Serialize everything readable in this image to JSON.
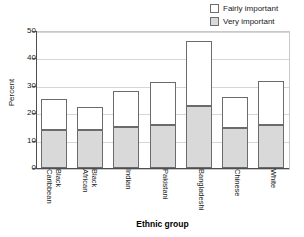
{
  "chart_data": {
    "type": "bar",
    "subtype": "stacked-vertical",
    "title": "",
    "xlabel": "Ethnic group",
    "ylabel": "Percent",
    "ylim": [
      0,
      50
    ],
    "yticks": [
      0,
      10,
      20,
      30,
      40,
      50
    ],
    "grid": true,
    "legend_position": "top-right",
    "categories": [
      "Black Caribbean",
      "Black African",
      "Indian",
      "Pakistani",
      "Bangladeshi",
      "Chinese",
      "White"
    ],
    "category_lines": [
      [
        "Black",
        "Caribbean"
      ],
      [
        "Black",
        "African"
      ],
      [
        "Indian"
      ],
      [
        "Pakistani"
      ],
      [
        "Bangladeshi"
      ],
      [
        "Chinese"
      ],
      [
        "White"
      ]
    ],
    "series": [
      {
        "name": "Very important",
        "color": "#d9d9d9",
        "values": [
          13.8,
          14.0,
          14.8,
          15.7,
          22.5,
          14.7,
          15.7
        ]
      },
      {
        "name": "Fairly important",
        "color": "#ffffff",
        "values": [
          11.2,
          7.8,
          12.9,
          15.3,
          23.5,
          10.8,
          15.8
        ]
      }
    ],
    "totals": [
      25.0,
      21.8,
      27.7,
      31.0,
      46.0,
      25.5,
      31.5
    ]
  },
  "legend": {
    "items": [
      {
        "label": "Fairly important",
        "swatch": "white"
      },
      {
        "label": "Very important",
        "swatch": "gray"
      }
    ]
  },
  "axes": {
    "y": {
      "title": "Percent",
      "ticks": [
        "0",
        "10",
        "20",
        "30",
        "40",
        "50"
      ]
    },
    "x": {
      "title": "Ethnic group"
    }
  },
  "colors": {
    "fairly_important": "#ffffff",
    "very_important": "#d9d9d9",
    "bar_outline": "#6b6b6b",
    "axis": "#4d4d4d",
    "gridline": "#d6d6d6",
    "text": "#1a1a1a"
  }
}
